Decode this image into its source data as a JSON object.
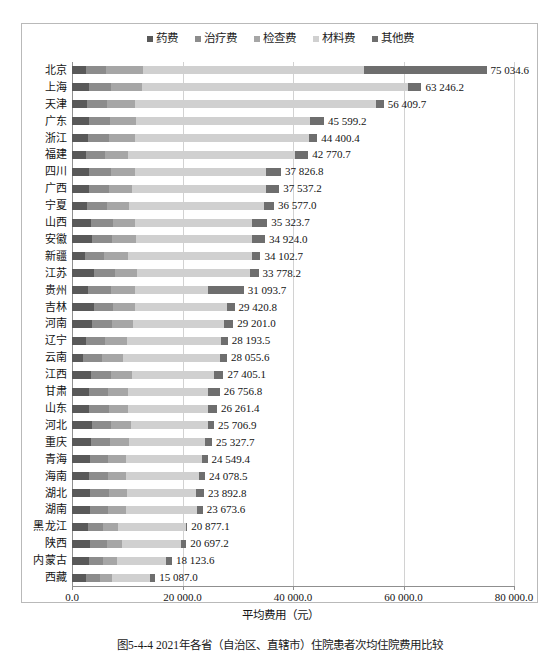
{
  "chart_data": {
    "type": "bar",
    "orientation": "horizontal",
    "stacked": true,
    "title": "",
    "xlabel": "平均费用（元）",
    "ylabel": "",
    "xlim": [
      0,
      80000
    ],
    "grid": true,
    "legend_position": "top-center",
    "xticks": [
      "0.0",
      "20 000.0",
      "40 000.0",
      "60 000.0",
      "80 000.0"
    ],
    "xtick_values": [
      0,
      20000,
      40000,
      60000,
      80000
    ],
    "categories": [
      "北京",
      "上海",
      "天津",
      "广东",
      "浙江",
      "福建",
      "四川",
      "广西",
      "宁夏",
      "山西",
      "安徽",
      "新疆",
      "江苏",
      "贵州",
      "吉林",
      "河南",
      "辽宁",
      "云南",
      "江西",
      "甘肃",
      "山东",
      "河北",
      "重庆",
      "青海",
      "海南",
      "湖北",
      "湖南",
      "黑龙江",
      "陕西",
      "内蒙古",
      "西藏"
    ],
    "totals": [
      75034.6,
      63246.2,
      56409.7,
      45599.2,
      44400.4,
      42770.7,
      37826.8,
      37537.2,
      36577.0,
      35323.7,
      34924.0,
      34102.7,
      33778.2,
      31093.7,
      29420.8,
      29201.0,
      28193.5,
      28055.6,
      27405.1,
      26756.8,
      26261.4,
      25706.9,
      25327.7,
      24549.4,
      24078.5,
      23892.8,
      23673.6,
      20877.1,
      20697.2,
      18123.6,
      15087.0
    ],
    "total_labels": [
      "75 034.6",
      "63 246.2",
      "56 409.7",
      "45 599.2",
      "44 400.4",
      "42 770.7",
      "37 826.8",
      "37 537.2",
      "36 577.0",
      "35 323.7",
      "34 924.0",
      "34 102.7",
      "33 778.2",
      "31 093.7",
      "29 420.8",
      "29 201.0",
      "28 193.5",
      "28 055.6",
      "27 405.1",
      "26 756.8",
      "26 261.4",
      "25 706.9",
      "25 327.7",
      "24 549.4",
      "24 078.5",
      "23 892.8",
      "23 673.6",
      "20 877.1",
      "20 697.2",
      "18 123.6",
      "15 087.0"
    ],
    "series": [
      {
        "name": "药费",
        "color": "#595959",
        "values": [
          2600,
          3100,
          2700,
          3050,
          2900,
          2500,
          3100,
          3000,
          2700,
          3500,
          3600,
          2300,
          4000,
          2900,
          4000,
          3600,
          2500,
          2000,
          3400,
          3000,
          3100,
          3600,
          3400,
          3300,
          3100,
          3300,
          3300,
          2900,
          3300,
          3100,
          2600
        ]
      },
      {
        "name": "治疗费",
        "color": "#8c8c8c",
        "values": [
          3600,
          3900,
          3700,
          3900,
          3800,
          3500,
          3900,
          3700,
          3600,
          3900,
          3700,
          3500,
          3700,
          4200,
          3500,
          3700,
          3500,
          3400,
          3700,
          3600,
          3600,
          3500,
          3500,
          3300,
          3400,
          3400,
          3300,
          2700,
          3100,
          2600,
          2500
        ]
      },
      {
        "name": "检查费",
        "color": "#a6a6a6",
        "values": [
          6600,
          5600,
          5000,
          4600,
          4700,
          4200,
          4400,
          4100,
          4000,
          4000,
          4200,
          4300,
          4000,
          4300,
          3900,
          3800,
          3900,
          3800,
          3700,
          3600,
          3500,
          3500,
          3400,
          3200,
          3300,
          3200,
          3100,
          2800,
          2700,
          2500,
          2100
        ]
      },
      {
        "name": "材料费",
        "color": "#d0d0d0",
        "values": [
          40000,
          48200,
          43600,
          31500,
          31500,
          30200,
          23800,
          24300,
          24500,
          21200,
          21000,
          22400,
          20500,
          13300,
          16700,
          16500,
          17000,
          17600,
          14900,
          14500,
          14400,
          14000,
          13800,
          13700,
          13200,
          12600,
          13000,
          12200,
          10600,
          8900,
          7000
        ]
      },
      {
        "name": "其他费",
        "color": "#6e6e6e",
        "values": [
          22234.6,
          2446.2,
          1409.7,
          2549.2,
          1500.4,
          2368.7,
          2626.8,
          2437.2,
          1777.0,
          2723.7,
          2424.0,
          1602.7,
          1578.2,
          6393.7,
          1320.8,
          1601.0,
          1293.5,
          1255.6,
          1705.1,
          2056.8,
          1661.4,
          1106.9,
          1227.7,
          1049.4,
          1078.5,
          1392.8,
          973.6,
          277.1,
          997.2,
          1023.6,
          887.0
        ]
      }
    ]
  },
  "legend": {
    "items": [
      {
        "label": "药费",
        "color": "#595959"
      },
      {
        "label": "治疗费",
        "color": "#8c8c8c"
      },
      {
        "label": "检查费",
        "color": "#a6a6a6"
      },
      {
        "label": "材料费",
        "color": "#d0d0d0"
      },
      {
        "label": "其他费",
        "color": "#6e6e6e"
      }
    ]
  },
  "caption": {
    "text": "图5-4-4  2021年各省（自治区、直辖市）住院患者次均住院费用比较"
  }
}
